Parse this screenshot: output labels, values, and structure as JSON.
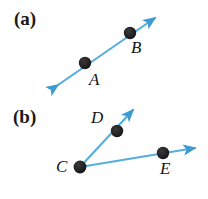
{
  "figure": {
    "width": 208,
    "height": 199,
    "background_color": "#ffffff",
    "line_color": "#55AEDD",
    "arrowhead_color": "#3D9BD4",
    "point_color": "#1A1A1A",
    "label_color": "#141414",
    "panels": [
      {
        "id": "a",
        "label": "(a)",
        "description": "line through points A and B with arrowheads on both ends"
      },
      {
        "id": "b",
        "label": "(b)",
        "description": "two rays from point C, one through D and one through E"
      }
    ],
    "labels": {
      "panel_a": "(a)",
      "panel_b": "(b)",
      "point_a": "A",
      "point_b": "B",
      "point_c": "C",
      "point_d": "D",
      "point_e": "E"
    },
    "geometry": {
      "panel_a": {
        "line": {
          "x1": 58,
          "y1": 85,
          "x2": 155,
          "y2": 18
        },
        "arrow_start": {
          "x": 55,
          "y": 88
        },
        "arrow_end": {
          "x": 158,
          "y": 15
        },
        "points": [
          {
            "name": "A",
            "x": 85,
            "y": 63,
            "r": 6
          },
          {
            "name": "B",
            "x": 130,
            "y": 33,
            "r": 6
          }
        ]
      },
      "panel_b": {
        "ray_cd": {
          "x1": 80,
          "y1": 167,
          "x2": 133,
          "y2": 110
        },
        "ray_ce": {
          "x1": 80,
          "y1": 167,
          "x2": 195,
          "y2": 148
        },
        "arrow_d_tip": {
          "x": 136,
          "y": 107
        },
        "arrow_e_tip": {
          "x": 198,
          "y": 147
        },
        "points": [
          {
            "name": "C",
            "x": 80,
            "y": 167,
            "r": 6
          },
          {
            "name": "D",
            "x": 117,
            "y": 131,
            "r": 6
          },
          {
            "name": "E",
            "x": 163,
            "y": 153,
            "r": 6
          }
        ]
      }
    }
  }
}
